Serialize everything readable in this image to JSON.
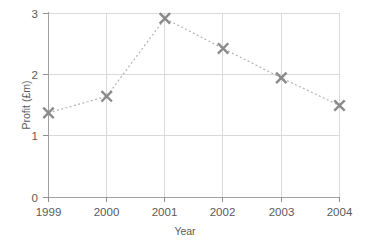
{
  "chart_data": {
    "type": "line",
    "title": "",
    "xlabel": "Year",
    "ylabel": "Profit (£m)",
    "categories": [
      "1999",
      "2000",
      "2001",
      "2002",
      "2003",
      "2004"
    ],
    "x": [
      1999,
      2000,
      2001,
      2002,
      2003,
      2004
    ],
    "values": [
      1.38,
      1.65,
      2.92,
      2.43,
      1.95,
      1.5
    ],
    "series": [
      {
        "name": "Profit",
        "values": [
          1.38,
          1.65,
          2.92,
          2.43,
          1.95,
          1.5
        ]
      }
    ],
    "xlim": [
      1999,
      2004
    ],
    "ylim": [
      0,
      3
    ],
    "ytick_labels": [
      "0",
      "1",
      "2",
      "3"
    ],
    "yticks": [
      0,
      1,
      2,
      3
    ],
    "xtick_labels": [
      "1999",
      "2000",
      "2001",
      "2002",
      "2003",
      "2004"
    ],
    "grid": true,
    "legend": false,
    "legend_position": "none",
    "marker": "x-marker",
    "line_style": "dotted",
    "colors": {
      "marker": "#8a8a8a",
      "line": "#b4b4b4",
      "grid": "#d9d9d9",
      "axis": "#a0a0a0",
      "text": "#5a5a5a",
      "background": "#ffffff"
    }
  },
  "axes": {
    "y_title": "Profit (£m)",
    "x_title": "Year",
    "y_tick_0": "0",
    "y_tick_1": "1",
    "y_tick_2": "2",
    "y_tick_3": "3",
    "x_tick_0": "1999",
    "x_tick_1": "2000",
    "x_tick_2": "2001",
    "x_tick_3": "2002",
    "x_tick_4": "2003",
    "x_tick_5": "2004"
  }
}
